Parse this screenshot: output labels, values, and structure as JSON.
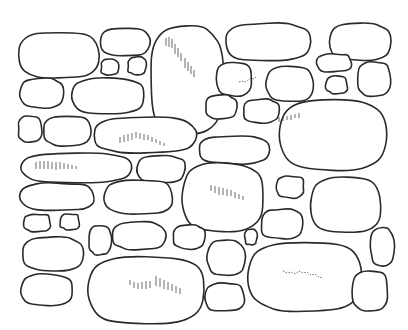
{
  "image": {
    "subject": "line drawing of a dry stone wall",
    "background": "#ffffff",
    "stroke_color": "#2a2a2a",
    "stones": [
      {
        "cx": 59,
        "cy": 55,
        "rx": 41,
        "ry": 23,
        "r": 30
      },
      {
        "cx": 125,
        "cy": 42,
        "rx": 25,
        "ry": 14,
        "r": 12
      },
      {
        "cx": 110,
        "cy": 67,
        "rx": 9,
        "ry": 8,
        "r": 8
      },
      {
        "cx": 137,
        "cy": 66,
        "rx": 9,
        "ry": 9,
        "r": 8
      },
      {
        "cx": 187,
        "cy": 80,
        "rx": 37,
        "ry": 55,
        "r": 40
      },
      {
        "cx": 268,
        "cy": 42,
        "rx": 43,
        "ry": 19,
        "r": 18
      },
      {
        "cx": 360,
        "cy": 42,
        "rx": 31,
        "ry": 19,
        "r": 12
      },
      {
        "cx": 42,
        "cy": 93,
        "rx": 22,
        "ry": 15,
        "r": 6
      },
      {
        "cx": 108,
        "cy": 96,
        "rx": 37,
        "ry": 18,
        "r": 18
      },
      {
        "cx": 234,
        "cy": 79,
        "rx": 18,
        "ry": 17,
        "r": 16
      },
      {
        "cx": 290,
        "cy": 84,
        "rx": 24,
        "ry": 18,
        "r": 18
      },
      {
        "cx": 334,
        "cy": 63,
        "rx": 18,
        "ry": 9,
        "r": 9
      },
      {
        "cx": 337,
        "cy": 85,
        "rx": 11,
        "ry": 9,
        "r": 9
      },
      {
        "cx": 374,
        "cy": 79,
        "rx": 17,
        "ry": 17,
        "r": 12
      },
      {
        "cx": 30,
        "cy": 129,
        "rx": 12,
        "ry": 13,
        "r": 8
      },
      {
        "cx": 67,
        "cy": 131,
        "rx": 24,
        "ry": 15,
        "r": 8
      },
      {
        "cx": 145,
        "cy": 135,
        "rx": 52,
        "ry": 18,
        "r": 16
      },
      {
        "cx": 221,
        "cy": 107,
        "rx": 16,
        "ry": 12,
        "r": 10
      },
      {
        "cx": 261,
        "cy": 111,
        "rx": 18,
        "ry": 12,
        "r": 8
      },
      {
        "cx": 234,
        "cy": 150,
        "rx": 36,
        "ry": 14,
        "r": 12
      },
      {
        "cx": 333,
        "cy": 135,
        "rx": 54,
        "ry": 36,
        "r": 35
      },
      {
        "cx": 76,
        "cy": 168,
        "rx": 56,
        "ry": 15,
        "r": 10
      },
      {
        "cx": 161,
        "cy": 169,
        "rx": 24,
        "ry": 14,
        "r": 10
      },
      {
        "cx": 223,
        "cy": 197,
        "rx": 41,
        "ry": 35,
        "r": 35
      },
      {
        "cx": 290,
        "cy": 187,
        "rx": 14,
        "ry": 11,
        "r": 10
      },
      {
        "cx": 346,
        "cy": 205,
        "rx": 36,
        "ry": 28,
        "r": 20
      },
      {
        "cx": 57,
        "cy": 197,
        "rx": 38,
        "ry": 14,
        "r": 12
      },
      {
        "cx": 139,
        "cy": 197,
        "rx": 35,
        "ry": 17,
        "r": 12
      },
      {
        "cx": 37,
        "cy": 223,
        "rx": 14,
        "ry": 9,
        "r": 8
      },
      {
        "cx": 70,
        "cy": 222,
        "rx": 10,
        "ry": 8,
        "r": 8
      },
      {
        "cx": 100,
        "cy": 240,
        "rx": 11,
        "ry": 15,
        "r": 10
      },
      {
        "cx": 139,
        "cy": 236,
        "rx": 27,
        "ry": 14,
        "r": 10
      },
      {
        "cx": 53,
        "cy": 254,
        "rx": 31,
        "ry": 17,
        "r": 12
      },
      {
        "cx": 189,
        "cy": 237,
        "rx": 16,
        "ry": 12,
        "r": 10
      },
      {
        "cx": 282,
        "cy": 224,
        "rx": 21,
        "ry": 15,
        "r": 12
      },
      {
        "cx": 251,
        "cy": 237,
        "rx": 6,
        "ry": 8,
        "r": 6
      },
      {
        "cx": 226,
        "cy": 258,
        "rx": 19,
        "ry": 18,
        "r": 10
      },
      {
        "cx": 382,
        "cy": 247,
        "rx": 12,
        "ry": 19,
        "r": 8
      },
      {
        "cx": 47,
        "cy": 290,
        "rx": 26,
        "ry": 16,
        "r": 8
      },
      {
        "cx": 146,
        "cy": 290,
        "rx": 59,
        "ry": 34,
        "r": 30
      },
      {
        "cx": 225,
        "cy": 297,
        "rx": 20,
        "ry": 14,
        "r": 12
      },
      {
        "cx": 305,
        "cy": 277,
        "rx": 58,
        "ry": 35,
        "r": 30
      },
      {
        "cx": 370,
        "cy": 291,
        "rx": 18,
        "ry": 20,
        "r": 10
      }
    ]
  }
}
